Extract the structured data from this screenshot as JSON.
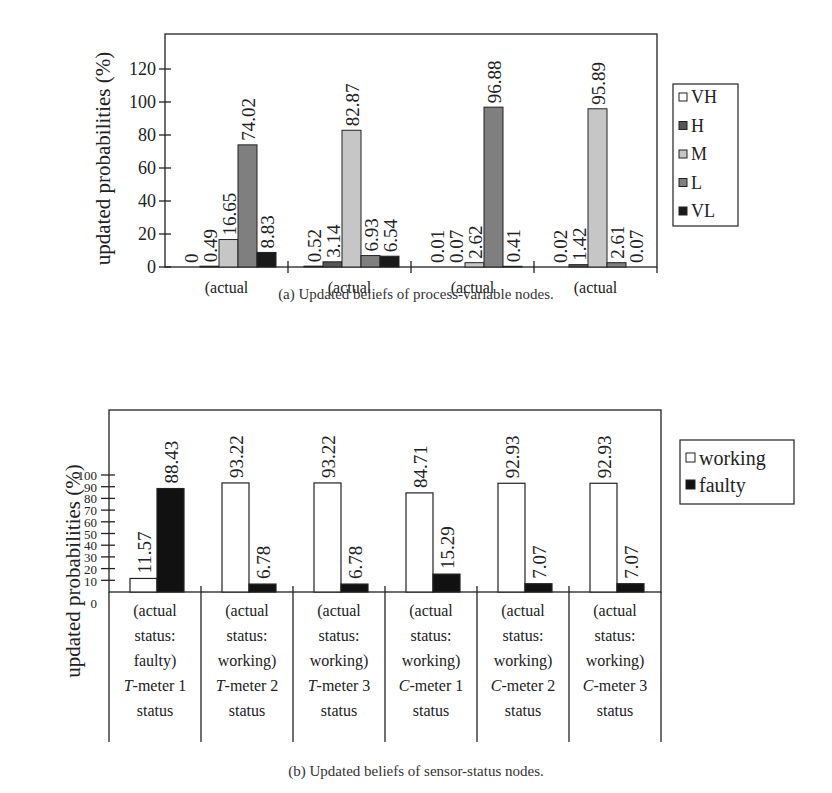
{
  "figure_a": {
    "caption": "(a) Updated beliefs of process-variable nodes.",
    "ylabel": "updated probabilities (%)",
    "legend": [
      {
        "label": "VH",
        "color": "#ffffff"
      },
      {
        "label": "H",
        "color": "#555555"
      },
      {
        "label": "M",
        "color": "#c6c6c6"
      },
      {
        "label": "L",
        "color": "#7f7f7f"
      },
      {
        "label": "VL",
        "color": "#1a1a1a"
      }
    ]
  },
  "figure_b": {
    "caption": "(b) Updated beliefs of sensor-status nodes.",
    "ylabel": "updated probabilities (%)",
    "legend": [
      {
        "label": "working",
        "color": "#ffffff"
      },
      {
        "label": "faulty",
        "color": "#111111"
      }
    ]
  },
  "chart_data": [
    {
      "type": "bar",
      "title": "(a) Updated beliefs of process-variable nodes.",
      "xlabel": "",
      "ylabel": "updated probabilities (%)",
      "ylim": [
        0,
        140
      ],
      "yticks": [
        0,
        20,
        40,
        60,
        80,
        100,
        120
      ],
      "grid": false,
      "legend_position": "right",
      "categories": [
        {
          "line1": "(actual",
          "line2": "value = L)",
          "node": "T",
          "sub": "0"
        },
        {
          "line1": "(actual",
          "line2": "value = M)",
          "node": "C",
          "sub": "0"
        },
        {
          "line1": "(actual",
          "line2": "value = L)",
          "node": "T",
          "sub": ""
        },
        {
          "line1": "(actual",
          "line2": "value = M)",
          "node": "C",
          "sub": ""
        }
      ],
      "series": [
        {
          "name": "VH",
          "color": "#ffffff",
          "values": [
            0,
            0.52,
            0.01,
            0.02
          ],
          "labels": [
            "0",
            "0.52",
            "0.01",
            "0.02"
          ]
        },
        {
          "name": "H",
          "color": "#555555",
          "values": [
            0.49,
            3.14,
            0.07,
            1.42
          ],
          "labels": [
            "0.49",
            "3.14",
            "0.07",
            "1.42"
          ]
        },
        {
          "name": "M",
          "color": "#c6c6c6",
          "values": [
            16.65,
            82.87,
            2.62,
            95.89
          ],
          "labels": [
            "16.65",
            "82.87",
            "2.62",
            "95.89"
          ]
        },
        {
          "name": "L",
          "color": "#7f7f7f",
          "values": [
            74.02,
            6.93,
            96.88,
            2.61
          ],
          "labels": [
            "74.02",
            "6.93",
            "96.88",
            "2.61"
          ]
        },
        {
          "name": "VL",
          "color": "#1a1a1a",
          "values": [
            8.83,
            6.54,
            0.41,
            0.07
          ],
          "labels": [
            "8.83",
            "6.54",
            "0.41",
            "0.07"
          ]
        }
      ]
    },
    {
      "type": "bar",
      "title": "(b) Updated beliefs of sensor-status nodes.",
      "xlabel": "",
      "ylabel": "updated probabilities (%)",
      "ylim": [
        0,
        155
      ],
      "yticks": [
        0,
        10,
        20,
        30,
        40,
        50,
        60,
        70,
        80,
        90,
        100
      ],
      "grid": false,
      "legend_position": "right",
      "categories": [
        {
          "lines": [
            "(actual",
            "status:",
            "faulty)"
          ],
          "meter_letter": "T",
          "meter_rest": "-meter 1",
          "last": "status"
        },
        {
          "lines": [
            "(actual",
            "status:",
            "working)"
          ],
          "meter_letter": "T",
          "meter_rest": "-meter 2",
          "last": "status"
        },
        {
          "lines": [
            "(actual",
            "status:",
            "working)"
          ],
          "meter_letter": "T",
          "meter_rest": "-meter 3",
          "last": "status"
        },
        {
          "lines": [
            "(actual",
            "status:",
            "working)"
          ],
          "meter_letter": "C",
          "meter_rest": "-meter 1",
          "last": "status"
        },
        {
          "lines": [
            "(actual",
            "status:",
            "working)"
          ],
          "meter_letter": "C",
          "meter_rest": "-meter 2",
          "last": "status"
        },
        {
          "lines": [
            "(actual",
            "status:",
            "working)"
          ],
          "meter_letter": "C",
          "meter_rest": "-meter 3",
          "last": "status"
        }
      ],
      "series": [
        {
          "name": "working",
          "color": "#ffffff",
          "values": [
            11.57,
            93.22,
            93.22,
            84.71,
            92.93,
            92.93
          ],
          "labels": [
            "11.57",
            "93.22",
            "93.22",
            "84.71",
            "92.93",
            "92.93"
          ]
        },
        {
          "name": "faulty",
          "color": "#111111",
          "values": [
            88.43,
            6.78,
            6.78,
            15.29,
            7.07,
            7.07
          ],
          "labels": [
            "88.43",
            "6.78",
            "6.78",
            "15.29",
            "7.07",
            "7.07"
          ]
        }
      ]
    }
  ]
}
